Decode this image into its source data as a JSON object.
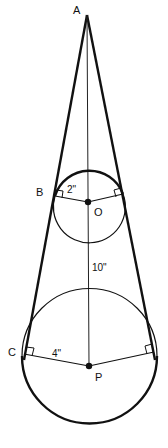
{
  "figure": {
    "points": {
      "A": {
        "label": "A",
        "x": 87,
        "y": 15
      },
      "B": {
        "label": "B",
        "x": 55,
        "y": 196
      },
      "O": {
        "label": "O",
        "x": 88,
        "y": 202
      },
      "C": {
        "label": "C",
        "x": 25,
        "y": 356
      },
      "P": {
        "label": "P",
        "x": 89,
        "y": 366
      }
    },
    "measurements": {
      "small_radius": "2\"",
      "large_radius": "4\"",
      "center_distance": "10\""
    },
    "colors": {
      "stroke": "#111111",
      "background": "#ffffff"
    }
  }
}
